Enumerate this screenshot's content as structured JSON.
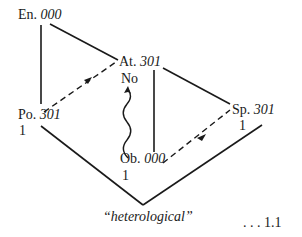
{
  "nodes": {
    "en": {
      "abbr": "En.",
      "code": "000"
    },
    "at": {
      "abbr": "At.",
      "code": "301",
      "sub": "No"
    },
    "po": {
      "abbr": "Po.",
      "code": "301",
      "sub": "1"
    },
    "sp": {
      "abbr": "Sp.",
      "code": "301",
      "sub": "1"
    },
    "ob": {
      "abbr": "Ob.",
      "code": "000",
      "sub": "1"
    }
  },
  "edges": [
    {
      "from": "en",
      "to": "po",
      "style": "solid"
    },
    {
      "from": "en",
      "to": "at",
      "style": "solid"
    },
    {
      "from": "po",
      "to": "at",
      "style": "dashed-arrow"
    },
    {
      "from": "at",
      "to": "ob",
      "style": "solid"
    },
    {
      "from": "at",
      "to": "sp",
      "style": "solid"
    },
    {
      "from": "ob",
      "to": "at",
      "style": "wavy-arrow"
    },
    {
      "from": "ob",
      "to": "sp",
      "style": "dashed-arrow"
    },
    {
      "from": "po",
      "to": "apex",
      "style": "solid"
    },
    {
      "from": "sp",
      "to": "apex",
      "style": "solid"
    }
  ],
  "caption": "“heterological”",
  "reference": ". . . 1.1",
  "colors": {
    "ink": "#1a1a1a",
    "background": "#ffffff"
  }
}
